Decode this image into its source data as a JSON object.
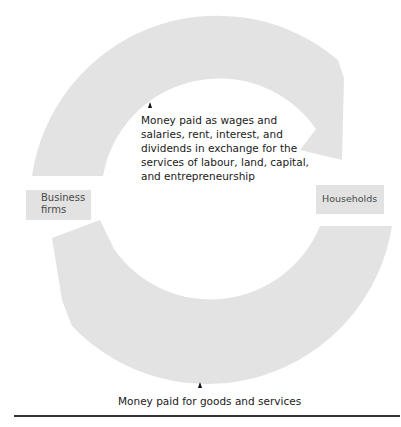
{
  "diagram": {
    "colors": {
      "ring": "#e3e3e3",
      "label_box": "#e2e2e2",
      "label_text": "#4a4a4a",
      "caption_text": "#1a1a1a",
      "rule": "#333333"
    },
    "nodes": {
      "business_firms": {
        "label": "Business firms",
        "line1": "Business",
        "line2": "firms"
      },
      "households": {
        "label": "Households"
      }
    },
    "flows": [
      {
        "id": "top",
        "from": "business_firms",
        "to": "households",
        "text": "Money paid as wages and salaries, rent, interest, and dividends in exchange for the services of labour, land, capital, and entrepreneurship"
      },
      {
        "id": "bottom",
        "from": "households",
        "to": "business_firms",
        "text": "Money paid for goods and services"
      }
    ]
  }
}
